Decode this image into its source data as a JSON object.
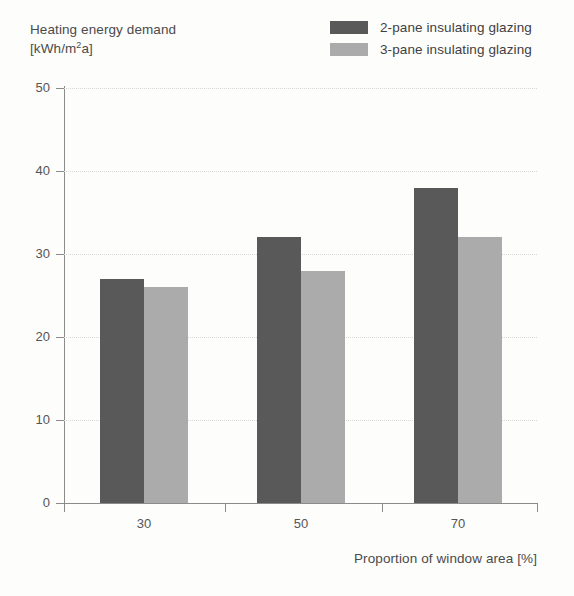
{
  "chart_data": {
    "type": "bar",
    "title": "",
    "ylabel": "Heating energy demand",
    "ylabel_unit": "[kWh/m²a]",
    "ylabel_unit_parts": {
      "pre": "[kWh/m",
      "sup": "2",
      "post": "a]"
    },
    "xlabel": "Proportion of window area [%]",
    "categories": [
      "30",
      "50",
      "70"
    ],
    "ylim": [
      0,
      50
    ],
    "yticks": [
      0,
      10,
      20,
      30,
      40,
      50
    ],
    "ytick_labels": [
      "0",
      "10",
      "20",
      "30",
      "40",
      "50"
    ],
    "grid": "horizontal-dotted",
    "legend_position": "top-right",
    "series": [
      {
        "name": "2-pane insulating glazing",
        "color": "#595959",
        "values": [
          27,
          32,
          38
        ]
      },
      {
        "name": "3-pane insulating glazing",
        "color": "#ababab",
        "values": [
          26,
          28,
          32
        ]
      }
    ]
  },
  "legend": {
    "items": [
      {
        "label": "2-pane insulating glazing",
        "swatch_color": "#595959"
      },
      {
        "label": "3-pane insulating glazing",
        "swatch_color": "#ababab"
      }
    ]
  },
  "colors": {
    "series_dark": "#595959",
    "series_light": "#ababab",
    "axis": "#8b8b8b",
    "grid": "#d7d7d5",
    "text": "#4a4a4a",
    "background": "#fdfdfc"
  }
}
